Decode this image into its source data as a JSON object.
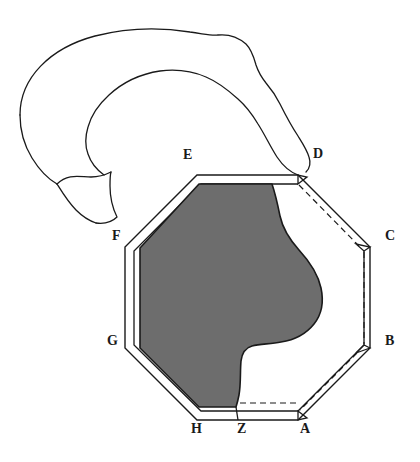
{
  "figure": {
    "colors": {
      "background": "#ffffff",
      "stroke": "#1a1a1a",
      "shaded_region_fill": "#6d6d6d",
      "shaded_region_stroke": "#1a1a1a",
      "dashed_line": "#1a1a1a",
      "label_text": "#1a1a1a"
    },
    "labels": [
      {
        "id": "A",
        "text": "A",
        "x": 300,
        "y": 429
      },
      {
        "id": "B",
        "text": "B",
        "x": 385,
        "y": 341
      },
      {
        "id": "C",
        "text": "C",
        "x": 385,
        "y": 236
      },
      {
        "id": "D",
        "text": "D",
        "x": 313,
        "y": 154
      },
      {
        "id": "E",
        "text": "E",
        "x": 183,
        "y": 155
      },
      {
        "id": "F",
        "text": "F",
        "x": 112,
        "y": 236
      },
      {
        "id": "G",
        "text": "G",
        "x": 108,
        "y": 341
      },
      {
        "id": "H",
        "text": "H",
        "x": 191,
        "y": 429
      },
      {
        "id": "Z",
        "text": "Z",
        "x": 237,
        "y": 429
      }
    ],
    "elements": {
      "octagon_outer": "outer octagon boundary A-B-C-D-E-F-G-H",
      "octagon_inner": "inner offset octagon outline",
      "shaded_region": "irregular shaded lobe inside the octagon",
      "band": "curved open ribbon band above and right of the octagon",
      "dashed_segments": [
        "D to C dashed chord",
        "C to B dashed chord",
        "B to A dashed chord",
        "Z to A dashed chord"
      ],
      "corner_wedges": [
        "wedge at D",
        "wedge at C",
        "wedge at B",
        "wedge at A"
      ]
    }
  }
}
